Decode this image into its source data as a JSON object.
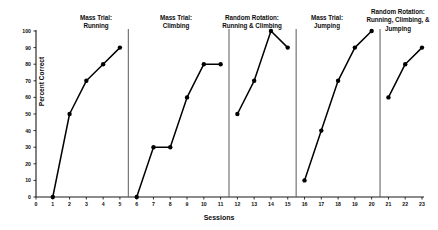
{
  "chart_data": {
    "type": "line",
    "title": "",
    "xlabel": "Sessions",
    "ylabel": "Percent Correct",
    "xlim": [
      0,
      23
    ],
    "ylim": [
      0,
      100
    ],
    "ytick_labels": [
      "0",
      "10",
      "20",
      "30",
      "40",
      "50",
      "60",
      "70",
      "80",
      "90",
      "100"
    ],
    "xtick_labels": [
      "0",
      "1",
      "2",
      "3",
      "4",
      "5",
      "6",
      "7",
      "8",
      "9",
      "10",
      "11",
      "12",
      "13",
      "14",
      "15",
      "16",
      "17",
      "18",
      "19",
      "20",
      "21",
      "22",
      "23"
    ],
    "grid": false,
    "legend": "none",
    "marker": "filled-circle",
    "line_color": "#000000",
    "phase_divider_color": "#595959",
    "phase_dividers_x": [
      5.5,
      11.5,
      15.5,
      20.5
    ],
    "panels": [
      {
        "name": "mass-trial-running",
        "title": "Mass Trial:\nRunning",
        "x": [
          1,
          2,
          3,
          4,
          5
        ],
        "y": [
          0,
          50,
          70,
          80,
          90
        ]
      },
      {
        "name": "mass-trial-climbing",
        "title": "Mass Trial:\nClimbing",
        "x": [
          6,
          7,
          8,
          9,
          10,
          11
        ],
        "y": [
          0,
          30,
          30,
          60,
          80,
          80
        ]
      },
      {
        "name": "random-rotation-running-climbing",
        "title": "Random Rotation:\nRunning & Climbing",
        "x": [
          12,
          13,
          14,
          15
        ],
        "y": [
          50,
          70,
          100,
          90
        ]
      },
      {
        "name": "mass-trial-jumping",
        "title": "Mass Trial:\nJumping",
        "x": [
          16,
          17,
          18,
          19,
          20
        ],
        "y": [
          10,
          40,
          70,
          90,
          100
        ]
      },
      {
        "name": "random-rotation-running-climbing-jumping",
        "title": "Random Rotation:\nRunning, Climbing, &\nJumping",
        "x": [
          21,
          22,
          23
        ],
        "y": [
          60,
          80,
          90
        ]
      }
    ]
  }
}
